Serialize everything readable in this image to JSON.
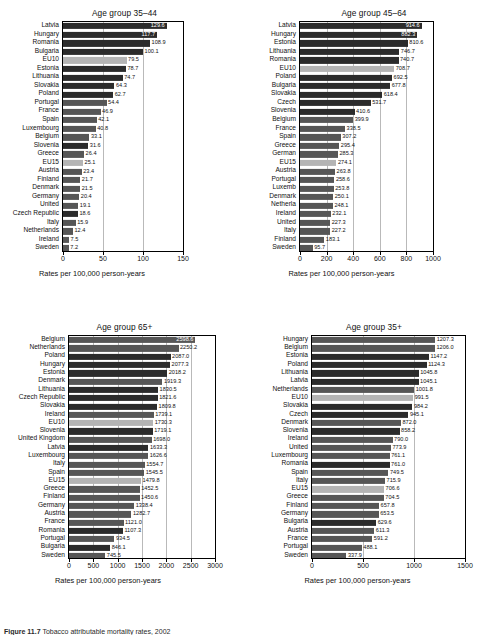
{
  "figure": {
    "caption_label": "Figure 11.7",
    "caption_text": "Tobacco attributable mortality rates, 2002",
    "xlabel": "Rates per 100,000 person-years",
    "colors": {
      "bar_dark": "#2b2b2b",
      "bar_mid": "#565656",
      "bar_light": "#b4b4b4",
      "gridline": "#b9b9b9",
      "axis": "#000000",
      "background": "#ffffff"
    }
  },
  "chart_data": [
    {
      "id": "age-35-44",
      "type": "bar",
      "orientation": "horizontal",
      "title": "Age group 35–44",
      "xlabel": "Rates per 100,000 person-years",
      "ylabel": "",
      "xlim": [
        0,
        150
      ],
      "xticks": [
        0,
        50,
        100,
        150
      ],
      "grid": true,
      "legend": "none",
      "categories": [
        "Latvia",
        "Hungary",
        "Romania",
        "Bulgaria",
        "EU10",
        "Estonia",
        "Lithuania",
        "Slovakia",
        "Poland",
        "Portugal",
        "France",
        "Spain",
        "Luxembourg",
        "Belgium",
        "Slovenia",
        "Greece",
        "EU15",
        "Austria",
        "Finland",
        "Denmark",
        "Germany",
        "United",
        "Czech Republic",
        "Italy",
        "Netherlands",
        "Ireland",
        "Sweden"
      ],
      "values": [
        129.6,
        117.7,
        108.9,
        100.1,
        79.5,
        78.7,
        74.7,
        64.3,
        62.7,
        54.4,
        46.9,
        42.1,
        40.8,
        33.1,
        31.6,
        26.4,
        25.1,
        23.4,
        21.7,
        21.5,
        20.4,
        19.1,
        18.6,
        15.9,
        12.4,
        7.5,
        7.2
      ],
      "shades": [
        "dark",
        "dark",
        "dark",
        "dark",
        "light",
        "dark",
        "dark",
        "dark",
        "dark",
        "mid",
        "mid",
        "mid",
        "mid",
        "mid",
        "dark",
        "mid",
        "light",
        "mid",
        "mid",
        "mid",
        "mid",
        "mid",
        "dark",
        "mid",
        "mid",
        "mid",
        "mid"
      ],
      "label_inside": [
        true,
        true,
        false,
        false,
        false,
        false,
        false,
        false,
        false,
        false,
        false,
        false,
        false,
        false,
        false,
        false,
        false,
        false,
        false,
        false,
        false,
        false,
        false,
        false,
        false,
        false,
        false
      ]
    },
    {
      "id": "age-45-64",
      "type": "bar",
      "orientation": "horizontal",
      "title": "Age group 45–64",
      "xlabel": "Rates per 100,000 person-years",
      "ylabel": "",
      "xlim": [
        0,
        1000
      ],
      "xticks": [
        0,
        200,
        400,
        600,
        800,
        1000
      ],
      "grid": true,
      "legend": "none",
      "categories": [
        "Latvia",
        "Hungary",
        "Estonia",
        "Lithuania",
        "Romania",
        "EU10",
        "Poland",
        "Bulgaria",
        "Slovakia",
        "Czech",
        "Slovenia",
        "Belgium",
        "France",
        "Spain",
        "Greece",
        "German",
        "EU15",
        "Austria",
        "Portugal",
        "Luxemb",
        "Denmark",
        "Netherla",
        "Ireland",
        "United",
        "Italy",
        "Finland",
        "Sweden"
      ],
      "values": [
        914.6,
        882.3,
        810.6,
        746.7,
        740.7,
        708.7,
        692.5,
        677.8,
        618.4,
        531.7,
        410.6,
        399.9,
        338.5,
        307.2,
        295.4,
        285.3,
        274.1,
        263.8,
        258.6,
        253.8,
        250.1,
        248.1,
        232.1,
        227.3,
        227.2,
        183.1,
        95.7
      ],
      "shades": [
        "dark",
        "dark",
        "dark",
        "dark",
        "dark",
        "light",
        "dark",
        "dark",
        "dark",
        "dark",
        "dark",
        "mid",
        "mid",
        "mid",
        "mid",
        "mid",
        "light",
        "mid",
        "mid",
        "mid",
        "mid",
        "mid",
        "mid",
        "mid",
        "mid",
        "mid",
        "mid"
      ],
      "label_inside": [
        true,
        true,
        false,
        false,
        false,
        false,
        false,
        false,
        false,
        false,
        false,
        false,
        false,
        false,
        false,
        false,
        false,
        false,
        false,
        false,
        false,
        false,
        false,
        false,
        false,
        false,
        false
      ]
    },
    {
      "id": "age-65-plus",
      "type": "bar",
      "orientation": "horizontal",
      "title": "Age group 65+",
      "xlabel": "Rates per 100,000 person-years",
      "ylabel": "",
      "xlim": [
        0,
        3000
      ],
      "xticks": [
        0,
        500,
        1000,
        1500,
        2000,
        2500,
        3000
      ],
      "grid": true,
      "legend": "none",
      "categories": [
        "Belgium",
        "Netherlands",
        "Poland",
        "Hungary",
        "Estonia",
        "Denmark",
        "Lithuania",
        "Czech Republic",
        "Slovakia",
        "Ireland",
        "EU10",
        "Slovenia",
        "United Kingdom",
        "Latvia",
        "Luxembourg",
        "Italy",
        "Spain",
        "EU15",
        "Greece",
        "Finland",
        "Germany",
        "Austria",
        "France",
        "Romania",
        "Portugal",
        "Bulgaria",
        "Sweden"
      ],
      "values": [
        2598.6,
        2250.2,
        2087.0,
        2077.3,
        2018.2,
        1919.3,
        1830.5,
        1821.6,
        1809.8,
        1739.1,
        1730.3,
        1719.1,
        1698.0,
        1633.3,
        1626.6,
        1554.7,
        1545.5,
        1479.8,
        1452.5,
        1450.6,
        1338.4,
        1282.7,
        1121.0,
        1107.3,
        934.5,
        846.1,
        745.5
      ],
      "shades": [
        "mid",
        "mid",
        "dark",
        "dark",
        "dark",
        "mid",
        "dark",
        "dark",
        "dark",
        "mid",
        "light",
        "dark",
        "mid",
        "dark",
        "mid",
        "mid",
        "mid",
        "light",
        "mid",
        "mid",
        "mid",
        "mid",
        "mid",
        "dark",
        "mid",
        "dark",
        "mid"
      ],
      "label_inside": [
        true,
        false,
        false,
        false,
        false,
        false,
        false,
        false,
        false,
        false,
        false,
        false,
        false,
        false,
        false,
        false,
        false,
        false,
        false,
        false,
        false,
        false,
        false,
        false,
        false,
        false,
        false
      ]
    },
    {
      "id": "age-35-plus",
      "type": "bar",
      "orientation": "horizontal",
      "title": "Age group 35+",
      "xlabel": "Rates per 100,000 person-years",
      "ylabel": "",
      "xlim": [
        0,
        1500
      ],
      "xticks": [
        0,
        500,
        1000,
        1500
      ],
      "grid": true,
      "legend": "none",
      "categories": [
        "Hungary",
        "Belgium",
        "Estonia",
        "Poland",
        "Lithuania",
        "Latvia",
        "Netherlands",
        "EU10",
        "Slovakia",
        "Czech",
        "Denmark",
        "Slovenia",
        "Ireland",
        "United",
        "Luxembourg",
        "Romania",
        "Spain",
        "Italy",
        "EU15",
        "Greece",
        "Finland",
        "Germany",
        "Bulgaria",
        "Austria",
        "France",
        "Portugal",
        "Sweden"
      ],
      "values": [
        1207.3,
        1206.0,
        1147.2,
        1124.3,
        1045.8,
        1045.1,
        1001.8,
        991.5,
        984.2,
        945.1,
        872.0,
        858.2,
        790.0,
        773.9,
        761.1,
        761.0,
        749.5,
        715.9,
        706.6,
        704.5,
        657.8,
        653.5,
        629.6,
        611.3,
        591.2,
        488.1,
        337.9
      ],
      "shades": [
        "mid",
        "mid",
        "dark",
        "dark",
        "dark",
        "dark",
        "mid",
        "light",
        "dark",
        "dark",
        "mid",
        "dark",
        "mid",
        "mid",
        "mid",
        "dark",
        "mid",
        "mid",
        "light",
        "mid",
        "mid",
        "mid",
        "dark",
        "mid",
        "mid",
        "mid",
        "mid"
      ],
      "label_inside": [
        false,
        false,
        false,
        false,
        false,
        false,
        false,
        false,
        false,
        false,
        false,
        false,
        false,
        false,
        false,
        false,
        false,
        false,
        false,
        false,
        false,
        false,
        false,
        false,
        false,
        false,
        false
      ]
    }
  ]
}
